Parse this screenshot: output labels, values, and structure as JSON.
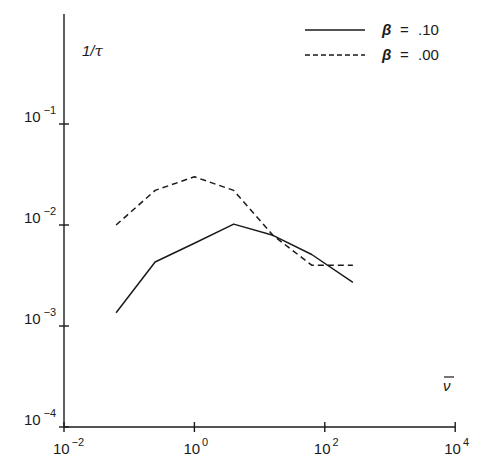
{
  "chart_data": {
    "type": "line",
    "title": "",
    "xlabel": "ν̄",
    "ylabel": "1/τ",
    "xscale": "log",
    "yscale": "log",
    "xlim": [
      0.01,
      10000
    ],
    "ylim": [
      0.0001,
      1
    ],
    "grid": false,
    "legend_position": "top-right",
    "x_ticks": [
      {
        "base": "10",
        "exp": "−2",
        "value": 0.01
      },
      {
        "base": "10",
        "exp": "0",
        "value": 1
      },
      {
        "base": "10",
        "exp": "2",
        "value": 100
      },
      {
        "base": "10",
        "exp": "4",
        "value": 10000
      }
    ],
    "y_ticks": [
      {
        "base": "10",
        "exp": "−4",
        "value": 0.0001
      },
      {
        "base": "10",
        "exp": "−3",
        "value": 0.001
      },
      {
        "base": "10",
        "exp": "−2",
        "value": 0.01
      },
      {
        "base": "10",
        "exp": "−1",
        "value": 0.1
      }
    ],
    "series": [
      {
        "name": "β = .10",
        "style": "solid",
        "x": [
          0.063,
          0.25,
          1.0,
          4.0,
          16,
          63,
          270
        ],
        "values": [
          0.00135,
          0.0043,
          0.0066,
          0.0102,
          0.0079,
          0.0051,
          0.0027
        ]
      },
      {
        "name": "β = .00",
        "style": "dashed",
        "x": [
          0.063,
          0.25,
          1.0,
          4.0,
          16,
          63,
          270
        ],
        "values": [
          0.01,
          0.022,
          0.03,
          0.022,
          0.0079,
          0.004,
          0.004
        ]
      }
    ]
  },
  "legend": [
    {
      "symbol": "β",
      "eq": "=",
      "value": ".10"
    },
    {
      "symbol": "β",
      "eq": "=",
      "value": ".00"
    }
  ],
  "axis_labels": {
    "x": "ν",
    "y": "1/τ"
  }
}
